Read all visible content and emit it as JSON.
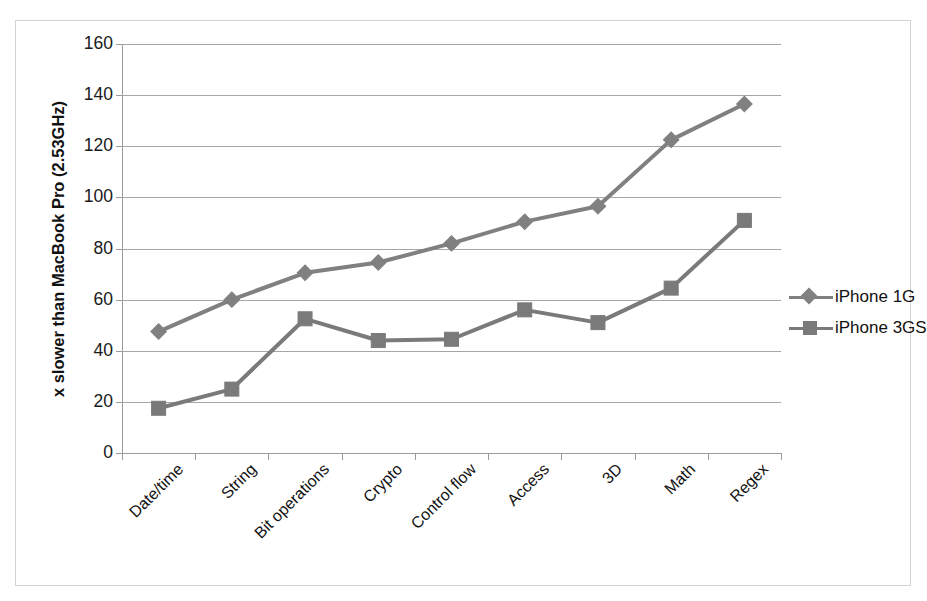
{
  "chart_data": {
    "type": "line",
    "title": "",
    "xlabel": "",
    "ylabel": "x slower than MacBook Pro (2.53GHz)",
    "ylim": [
      0,
      160
    ],
    "yticks": [
      0,
      20,
      40,
      60,
      80,
      100,
      120,
      140,
      160
    ],
    "grid": true,
    "legend_position": "right",
    "categories": [
      "Date/time",
      "String",
      "Bit operations",
      "Crypto",
      "Control flow",
      "Access",
      "3D",
      "Math",
      "Regex"
    ],
    "series": [
      {
        "name": "iPhone 1G",
        "marker": "diamond",
        "color": "#808080",
        "values": [
          47.5,
          60,
          70.5,
          74.5,
          82,
          90.5,
          96.5,
          122.5,
          136.5
        ]
      },
      {
        "name": "iPhone 3GS",
        "marker": "square",
        "color": "#7a7a7a",
        "values": [
          17.5,
          25,
          52.5,
          44,
          44.5,
          56,
          51,
          64.5,
          91
        ]
      }
    ]
  },
  "legend": {
    "items": [
      {
        "label": "iPhone 1G",
        "marker": "diamond-marker"
      },
      {
        "label": "iPhone 3GS",
        "marker": "square-marker"
      }
    ]
  },
  "colors": {
    "series_1": "#808080",
    "series_2": "#7a7a7a",
    "gridline": "#a6a6a6",
    "axis": "#9a9a9a",
    "frame_border": "#d4d4d4",
    "text": "#111111",
    "background": "#ffffff"
  }
}
